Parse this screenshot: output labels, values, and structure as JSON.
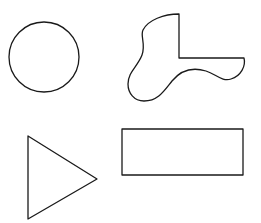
{
  "canvas": {
    "width": 261,
    "height": 223,
    "background": "#ffffff"
  },
  "stroke_color": "#1a1a1a",
  "shapes": [
    {
      "name": "circle",
      "type": "circle",
      "cx": 44,
      "cy": 57,
      "r": 35
    },
    {
      "name": "irregular-blob",
      "type": "freeform"
    },
    {
      "name": "triangle",
      "type": "polygon",
      "points": [
        [
          28,
          136
        ],
        [
          97,
          179
        ],
        [
          28,
          219
        ]
      ]
    },
    {
      "name": "rectangle",
      "type": "rect",
      "x": 122,
      "y": 129,
      "width": 121,
      "height": 46
    }
  ]
}
